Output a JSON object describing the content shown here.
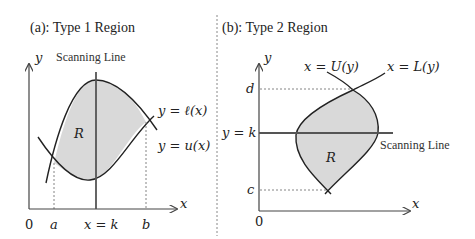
{
  "panels": [
    {
      "title": "(a): Type 1 Region",
      "scan_label": "Scanning Line",
      "axis_x": "x",
      "axis_y": "y",
      "origin": "0",
      "region_label": "R",
      "upper_curve_label": "y = ℓ(x)",
      "lower_curve_label": "y = u(x)",
      "ticks": {
        "a": "a",
        "k": "x = k",
        "b": "b"
      }
    },
    {
      "title": "(b): Type 2 Region",
      "scan_label": "Scanning Line",
      "axis_x": "x",
      "axis_y": "y",
      "origin": "0",
      "region_label": "R",
      "left_curve_label": "x = U(y)",
      "right_curve_label": "x = L(y)",
      "ticks": {
        "d": "d",
        "k": "y = k",
        "c": "c"
      }
    }
  ],
  "colors": {
    "fill": "#d9d9d9",
    "stroke": "#222222",
    "scan": "#555555",
    "divider": "#888888"
  }
}
